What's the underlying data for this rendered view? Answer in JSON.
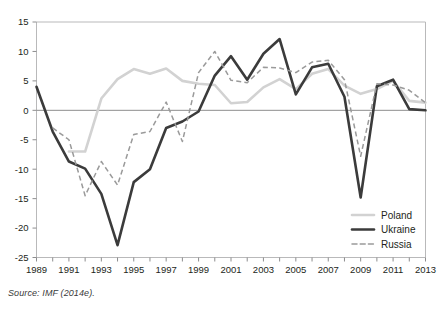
{
  "chart_data": {
    "type": "line",
    "title": "",
    "subtitle": "",
    "xlabel": "",
    "ylabel": "",
    "xlim": [
      1989,
      2013
    ],
    "ylim": [
      -25,
      15
    ],
    "ytick_values": [
      15,
      10,
      5,
      0,
      -5,
      -10,
      -15,
      -20,
      -25
    ],
    "ytick_labels": [
      "15",
      "10",
      "5",
      "0",
      "-5",
      "-10",
      "-15",
      "-20",
      "-25"
    ],
    "xtick_values": [
      1989,
      1990,
      1991,
      1992,
      1993,
      1994,
      1995,
      1996,
      1997,
      1998,
      1999,
      2000,
      2001,
      2002,
      2003,
      2004,
      2005,
      2006,
      2007,
      2008,
      2009,
      2010,
      2011,
      2012,
      2013
    ],
    "xtick_labels_shown": [
      "1989",
      "1991",
      "1993",
      "1995",
      "1997",
      "1999",
      "2001",
      "2003",
      "2005",
      "2007",
      "2009",
      "2011",
      "2013"
    ],
    "grid": false,
    "zero_line": true,
    "legend_position": "bottom-right",
    "x": [
      1989,
      1990,
      1991,
      1992,
      1993,
      1994,
      1995,
      1996,
      1997,
      1998,
      1999,
      2000,
      2001,
      2002,
      2003,
      2004,
      2005,
      2006,
      2007,
      2008,
      2009,
      2010,
      2011,
      2012,
      2013
    ],
    "series": [
      {
        "name": "Poland",
        "color": "#d2d2d2",
        "style": "solid",
        "values": [
          null,
          null,
          -7.0,
          -7.0,
          2.0,
          5.3,
          7.0,
          6.2,
          7.1,
          5.0,
          4.5,
          4.3,
          1.2,
          1.4,
          3.9,
          5.3,
          3.6,
          6.2,
          7.0,
          4.2,
          2.8,
          3.6,
          5.0,
          1.6,
          1.3
        ]
      },
      {
        "name": "Ukraine",
        "color": "#3b3b3b",
        "style": "solid",
        "values": [
          4.0,
          -3.6,
          -8.7,
          -9.9,
          -14.2,
          -22.9,
          -12.2,
          -10.0,
          -3.0,
          -1.9,
          -0.2,
          5.9,
          9.2,
          5.2,
          9.6,
          12.1,
          2.7,
          7.3,
          7.9,
          2.3,
          -14.8,
          4.1,
          5.2,
          0.2,
          0.0
        ]
      },
      {
        "name": "Russia",
        "color": "#9a9a9a",
        "style": "dashed",
        "values": [
          null,
          -3.0,
          -5.0,
          -14.5,
          -8.7,
          -12.7,
          -4.1,
          -3.6,
          1.4,
          -5.3,
          6.4,
          10.0,
          5.1,
          4.7,
          7.3,
          7.2,
          6.4,
          8.2,
          8.5,
          5.2,
          -7.8,
          4.5,
          4.3,
          3.4,
          1.3
        ]
      }
    ]
  },
  "legend": {
    "entries": [
      {
        "label": "Poland"
      },
      {
        "label": "Ukraine"
      },
      {
        "label": "Russia"
      }
    ]
  },
  "footer": {
    "source": "Source: IMF (2014e)."
  }
}
